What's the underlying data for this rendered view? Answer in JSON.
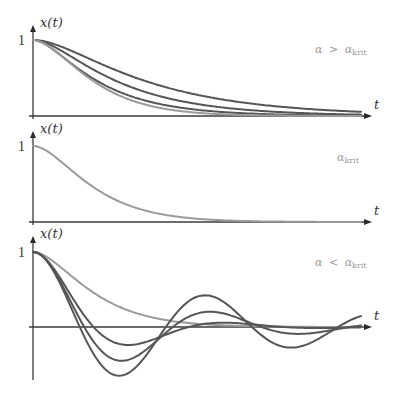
{
  "figure": {
    "panels": [
      {
        "id": "overdamped",
        "y_axis_label": "x(t)",
        "x_axis_label": "t",
        "y_tick_label": "1",
        "condition": {
          "alpha": "α",
          "relation": ">",
          "alpha2": "α",
          "subscript": "krit"
        },
        "curves": [
          {
            "kind": "overdamped",
            "rate": 0.01,
            "color": "#555555"
          },
          {
            "kind": "overdamped",
            "rate": 0.0135,
            "color": "#555555"
          },
          {
            "kind": "overdamped",
            "rate": 0.0175,
            "color": "#555555"
          },
          {
            "kind": "critical",
            "rate": 0.03,
            "color": "#9a9a9a"
          }
        ]
      },
      {
        "id": "critical",
        "y_axis_label": "x(t)",
        "x_axis_label": "t",
        "y_tick_label": "1",
        "condition": {
          "alpha": "",
          "relation": "",
          "alpha2": "α",
          "subscript": "krit"
        },
        "curves": [
          {
            "kind": "critical",
            "rate": 0.03,
            "color": "#9a9a9a"
          }
        ]
      },
      {
        "id": "underdamped",
        "y_axis_label": "x(t)",
        "x_axis_label": "t",
        "y_tick_label": "1",
        "condition": {
          "alpha": "α",
          "relation": "<",
          "alpha2": "α",
          "subscript": "krit"
        },
        "curves": [
          {
            "kind": "critical",
            "rate": 0.03,
            "color": "#9a9a9a"
          },
          {
            "kind": "underdamped",
            "delta": 0.015,
            "omega": 0.033,
            "color": "#555555"
          },
          {
            "kind": "underdamped",
            "delta": 0.009,
            "omega": 0.0355,
            "color": "#555555"
          },
          {
            "kind": "underdamped",
            "delta": 0.005,
            "omega": 0.0365,
            "color": "#555555"
          }
        ]
      }
    ]
  }
}
